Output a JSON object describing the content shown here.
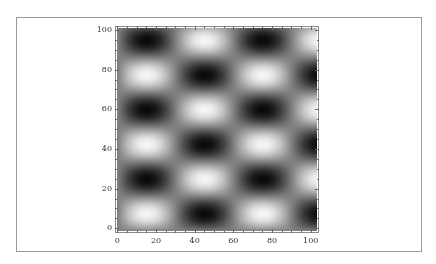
{
  "chart_data": {
    "type": "heatmap",
    "subtype": "density_plot",
    "title": "",
    "xlabel": "",
    "ylabel": "",
    "xlim": [
      0,
      100
    ],
    "ylim": [
      0,
      100
    ],
    "x_ticks": [
      0,
      20,
      40,
      60,
      80,
      100
    ],
    "y_ticks": [
      0,
      20,
      40,
      60,
      80,
      100
    ],
    "x_tick_labels": [
      "0",
      "20",
      "40",
      "60",
      "80",
      "100"
    ],
    "y_tick_labels": [
      "0",
      "20",
      "40",
      "60",
      "80",
      "100"
    ],
    "colormap": "grayscale",
    "grid": false,
    "legend": null,
    "pattern": {
      "description": "Checkerboard of alternating dark and light elliptical blobs",
      "x_period": 60,
      "y_period": 35,
      "x_phase": 15,
      "y_phase": 95,
      "brightness_formula": "0.5 - 0.5*cos(2*pi*(x-x_phase)/x_period)*cos(2*pi*(y-y_phase)/y_period)"
    },
    "dark_spots": [
      [
        15,
        95
      ],
      [
        75,
        95
      ],
      [
        45,
        78
      ],
      [
        100,
        78
      ],
      [
        15,
        61
      ],
      [
        75,
        61
      ],
      [
        45,
        44
      ],
      [
        100,
        44
      ],
      [
        15,
        27
      ],
      [
        75,
        27
      ],
      [
        45,
        9
      ],
      [
        100,
        9
      ]
    ],
    "bright_spots": [
      [
        45,
        95
      ],
      [
        15,
        78
      ],
      [
        75,
        78
      ],
      [
        45,
        61
      ],
      [
        15,
        44
      ],
      [
        75,
        44
      ],
      [
        45,
        27
      ],
      [
        15,
        9
      ],
      [
        75,
        9
      ]
    ]
  },
  "layout": {
    "plot_px": {
      "x0": 117.3,
      "x1": 310.7,
      "y0": 228.3,
      "y1": 30
    }
  }
}
